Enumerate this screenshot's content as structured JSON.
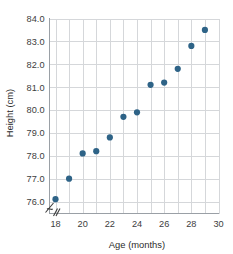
{
  "chart_data": {
    "type": "scatter",
    "title": "",
    "xlabel": "Age (months)",
    "ylabel": "Height (cm)",
    "xlim": [
      17,
      30
    ],
    "ylim": [
      75.6,
      84.0
    ],
    "grid": true,
    "legend": null,
    "axis_break": true,
    "marker_color": "#2e6387",
    "gridline_color": "#d5d7da",
    "axis_color": "#9aa0a6",
    "x_ticks": [
      18,
      20,
      22,
      24,
      26,
      28,
      30
    ],
    "x_tick_labels": [
      "18",
      "20",
      "22",
      "24",
      "26",
      "28",
      "30"
    ],
    "x_gridlines": [
      18,
      19,
      20,
      21,
      22,
      23,
      24,
      25,
      26,
      27,
      28,
      29,
      30
    ],
    "y_ticks": [
      76.0,
      77.0,
      78.0,
      79.0,
      80.0,
      81.0,
      82.0,
      83.0,
      84.0
    ],
    "y_tick_labels": [
      "76.0",
      "77.0",
      "78.0",
      "79.0",
      "80.0",
      "81.0",
      "82.0",
      "83.0",
      "84.0"
    ],
    "x": [
      18,
      19,
      20,
      21,
      22,
      23,
      24,
      25,
      26,
      27,
      28,
      29
    ],
    "y": [
      76.1,
      77.0,
      78.1,
      78.2,
      78.8,
      79.7,
      79.9,
      81.1,
      81.2,
      81.8,
      82.8,
      83.5
    ],
    "points": [
      {
        "x": 18,
        "y": 76.1
      },
      {
        "x": 19,
        "y": 77.0
      },
      {
        "x": 20,
        "y": 78.1
      },
      {
        "x": 21,
        "y": 78.2
      },
      {
        "x": 22,
        "y": 78.8
      },
      {
        "x": 23,
        "y": 79.7
      },
      {
        "x": 24,
        "y": 79.9
      },
      {
        "x": 25,
        "y": 81.1
      },
      {
        "x": 26,
        "y": 81.2
      },
      {
        "x": 27,
        "y": 81.8
      },
      {
        "x": 28,
        "y": 82.8
      },
      {
        "x": 29,
        "y": 83.5
      }
    ]
  }
}
